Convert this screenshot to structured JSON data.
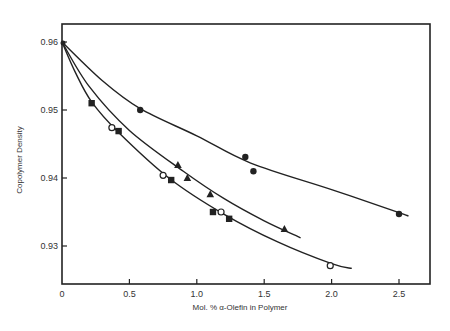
{
  "chart_data": {
    "type": "scatter",
    "title": "",
    "xlabel": "Mol. % α-Olefin in Polymer",
    "ylabel": "Copolymer Density",
    "xlim": [
      0,
      2.7
    ],
    "ylim": [
      0.9244,
      0.9628
    ],
    "xticks": [
      0,
      0.5,
      1.0,
      1.5,
      2.0,
      2.5
    ],
    "xtick_labels": [
      "0",
      "0.5",
      "1.0",
      "1.5",
      "2.0",
      "2.5"
    ],
    "yticks": [
      0.93,
      0.94,
      0.95,
      0.96
    ],
    "ytick_labels": [
      "0.93",
      "0.94",
      "0.95",
      "0.96"
    ],
    "grid": false,
    "legend": null,
    "origin_point": {
      "x": 0,
      "y": 0.96
    },
    "series": [
      {
        "name": "filled-circles",
        "marker": "filled-circle",
        "x": [
          0.58,
          1.36,
          1.42,
          2.5
        ],
        "y": [
          0.95,
          0.9431,
          0.941,
          0.9347
        ],
        "fit_curve": {
          "x": [
            0,
            0.3,
            0.58,
            1.0,
            1.4,
            2.0,
            2.5,
            2.57
          ],
          "y": [
            0.96,
            0.9543,
            0.9502,
            0.9462,
            0.9422,
            0.9383,
            0.9349,
            0.9344
          ]
        }
      },
      {
        "name": "filled-triangles",
        "marker": "filled-triangle",
        "x": [
          0.86,
          0.93,
          1.1,
          1.65
        ],
        "y": [
          0.9419,
          0.94,
          0.9376,
          0.9325
        ],
        "fit_curve": {
          "x": [
            0,
            0.2,
            0.5,
            0.9,
            1.2,
            1.5,
            1.77
          ],
          "y": [
            0.96,
            0.9535,
            0.947,
            0.941,
            0.937,
            0.9337,
            0.9312
          ]
        }
      },
      {
        "name": "filled-squares",
        "marker": "filled-square",
        "x": [
          0.22,
          0.42,
          0.81,
          1.12,
          1.24
        ],
        "y": [
          0.951,
          0.9469,
          0.9397,
          0.935,
          0.934
        ]
      },
      {
        "name": "open-circles",
        "marker": "open-circle",
        "x": [
          0.37,
          0.75,
          1.18,
          1.99
        ],
        "y": [
          0.9474,
          0.9404,
          0.935,
          0.9271
        ],
        "fit_curve": {
          "x": [
            0,
            0.1,
            0.22,
            0.42,
            0.8,
            1.2,
            1.6,
            2.0,
            2.15
          ],
          "y": [
            0.96,
            0.9555,
            0.9512,
            0.9467,
            0.9399,
            0.9347,
            0.9306,
            0.9274,
            0.9267
          ]
        }
      }
    ]
  }
}
